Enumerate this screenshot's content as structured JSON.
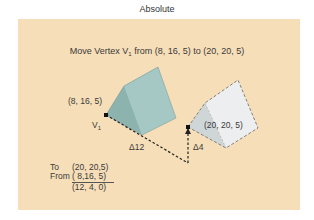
{
  "title": "Absolute",
  "heading": {
    "prefix": "Move Vertex V",
    "sub": "1",
    "suffix": " from (8, 16, 5) to (20, 20, 5)"
  },
  "labels": {
    "start_coord": "(8, 16, 5)",
    "vertex_name": "V",
    "vertex_sub": "1",
    "end_coord": "(20, 20, 5)",
    "delta_x": "Δ12",
    "delta_y": "Δ4"
  },
  "calculation": {
    "to_label": "To",
    "to_value": "(20, 20,5)",
    "from_label": "From",
    "from_value": "( 8,16, 5)",
    "result": "(12,  4, 0)"
  },
  "colors": {
    "panel_bg": "#f6deb8",
    "solid_prism_front": "#8fb5b0",
    "solid_prism_side": "#a9c9c6",
    "ghost_prism_front": "#dfe3e4",
    "ghost_prism_side": "#eef0f0",
    "dash": "#222222"
  }
}
